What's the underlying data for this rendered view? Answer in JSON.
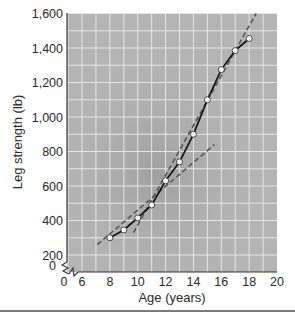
{
  "chart_data": {
    "type": "line",
    "title": "",
    "xlabel": "Age (years)",
    "ylabel": "Leg strength (lb)",
    "xlim": [
      6,
      20
    ],
    "ylim": [
      0,
      1600
    ],
    "axis_break": {
      "x": true,
      "y": true
    },
    "x_ticks": [
      0,
      6,
      8,
      10,
      12,
      14,
      16,
      18,
      20
    ],
    "x_tick_labels": [
      "0",
      "6",
      "8",
      "10",
      "12",
      "14",
      "16",
      "18",
      "20"
    ],
    "y_ticks": [
      0,
      200,
      400,
      600,
      800,
      1000,
      1200,
      1400,
      1600
    ],
    "y_tick_labels": [
      "0",
      "200",
      "400",
      "600",
      "800",
      "1,000",
      "1,200",
      "1,400",
      "1,600"
    ],
    "grid": true,
    "legend": null,
    "series": [
      {
        "name": "Leg strength",
        "style": "solid-with-open-circle-markers",
        "x": [
          8,
          9,
          10,
          11,
          12,
          13,
          14,
          15,
          16,
          17,
          18
        ],
        "values": [
          300,
          345,
          415,
          490,
          630,
          740,
          900,
          1100,
          1275,
          1385,
          1455
        ]
      },
      {
        "name": "Pre-adolescent trend",
        "style": "dashed",
        "x": [
          7.1,
          15.5
        ],
        "values": [
          260,
          840
        ]
      },
      {
        "name": "Adolescent trend",
        "style": "dashed",
        "x": [
          9.7,
          18.5
        ],
        "values": [
          330,
          1600
        ]
      }
    ]
  },
  "colors": {
    "plot_bg": "#b4b4b4",
    "grid": "#e6e6e6",
    "line": "#111111",
    "dashed": "#555555",
    "marker_fill": "#ffffff"
  }
}
